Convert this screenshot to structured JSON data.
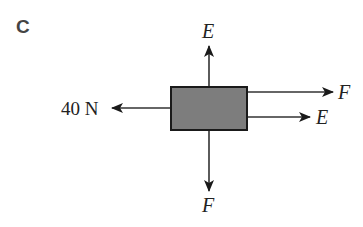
{
  "figure": {
    "panel_label": "C",
    "block": {
      "fill": "#7d7d7d",
      "stroke": "#1a1a1a"
    },
    "forces": {
      "up": {
        "label": "E"
      },
      "down": {
        "label": "F"
      },
      "left": {
        "label": "40 N"
      },
      "right_top": {
        "label": "F"
      },
      "right_bottom": {
        "label": "E"
      }
    }
  }
}
